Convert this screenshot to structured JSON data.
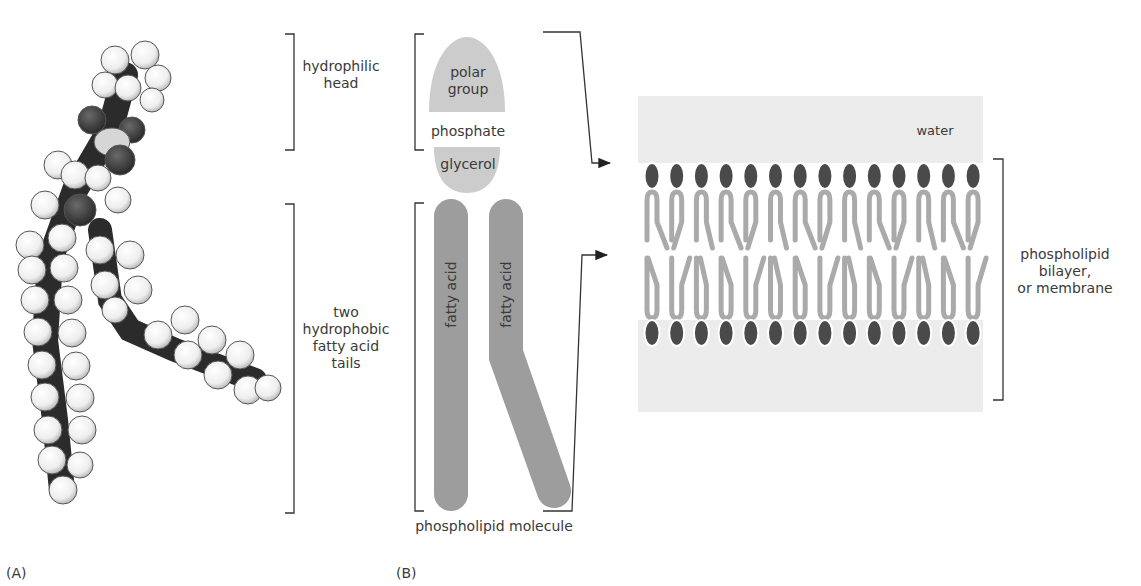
{
  "panels": {
    "a": {
      "label": "(A)",
      "content": "space-filling model of phospholipid"
    },
    "b": {
      "label": "(B)"
    }
  },
  "molecule_labels": {
    "hydrophilic_head": [
      "hydrophilic",
      "head"
    ],
    "hydrophobic_tails": [
      "two",
      "hydrophobic",
      "fatty acid",
      "tails"
    ]
  },
  "schematic": {
    "polar_group": [
      "polar",
      "group"
    ],
    "phosphate": "phosphate",
    "glycerol": "glycerol",
    "fatty_acid_1": "fatty acid",
    "fatty_acid_2": "fatty acid",
    "caption": "phospholipid molecule"
  },
  "bilayer": {
    "water_label": "water",
    "side_label": [
      "phospholipid",
      "bilayer,",
      "or membrane"
    ],
    "heads_per_leaflet": 14
  },
  "colors": {
    "head_fill": "#cccccc",
    "tail_fill": "#9d9d9d",
    "bilayer_head": "#4a4a4a",
    "bilayer_tail": "#aaaaaa",
    "water": "#ececec",
    "bracket": "#333333"
  }
}
